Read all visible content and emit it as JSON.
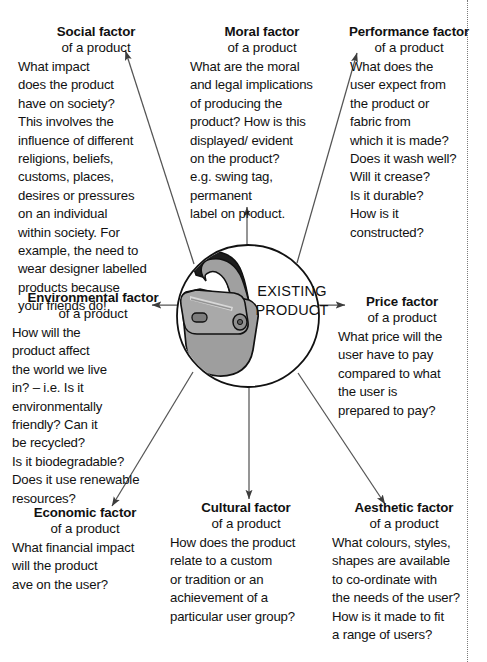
{
  "diagram": {
    "center": {
      "label_line1": "EXISTING",
      "label_line2": "PRODUCT",
      "illustration": "shoulder-bag",
      "circle_color": "#ffffff",
      "bag_fill": "#9b9b9b",
      "outline_color": "#111111"
    },
    "subtitle_common": "of a product",
    "arrow_color": "#4a4a4a",
    "factors": [
      {
        "id": "social",
        "title": "Social factor",
        "subtitle": "of a product",
        "body": "What impact\ndoes the product\nhave on society?\nThis involves the\ninfluence of different\nreligions, beliefs,\ncustoms, places,\ndesires or pressures\non an individual\nwithin society. For\nexample, the need to\nwear designer labelled\nproducts because\nyour friends do!",
        "arrow_direction": "up-left"
      },
      {
        "id": "moral",
        "title": "Moral factor",
        "subtitle": "of a product",
        "body": "What are the moral\nand legal implications\nof producing the\nproduct? How is this\ndisplayed/ evident\non the product?\ne.g. swing tag,\npermanent\nlabel on product.",
        "arrow_direction": "up"
      },
      {
        "id": "performance",
        "title": "Performance factor",
        "subtitle": "of a product",
        "body": "What does the\nuser expect from\nthe product or\nfabric from\nwhich it is made?\nDoes it wash well?\nWill it crease?\nIs it durable?\nHow is it\nconstructed?",
        "arrow_direction": "up-right"
      },
      {
        "id": "environmental",
        "title": "Environmental factor",
        "subtitle": "of a product",
        "body": "How will the\nproduct affect\nthe world we live\nin? – i.e. Is it\nenvironmentally\nfriendly? Can it\nbe recycled?\nIs it biodegradable?\nDoes  it use renewable\nresources?",
        "arrow_direction": "left"
      },
      {
        "id": "price",
        "title": "Price factor",
        "subtitle": "of a product",
        "body": "What price will the\nuser have to pay\ncompared to what\nthe user is\nprepared to pay?",
        "arrow_direction": "right"
      },
      {
        "id": "economic",
        "title": "Economic factor",
        "subtitle": "of a product",
        "body": "What financial impact\nwill the product\nave on the user?",
        "arrow_direction": "down-left"
      },
      {
        "id": "cultural",
        "title": "Cultural factor",
        "subtitle": "of a product",
        "body": "How does the product\nrelate to a custom\nor tradition or an\nachievement of a\nparticular user group?",
        "arrow_direction": "down"
      },
      {
        "id": "aesthetic",
        "title": "Aesthetic factor",
        "subtitle": "of a product",
        "body": "What colours, styles,\nshapes are available\nto co-ordinate with\nthe needs of the user?\nHow is it made to fit\na range of users?",
        "arrow_direction": "down-right"
      }
    ]
  }
}
